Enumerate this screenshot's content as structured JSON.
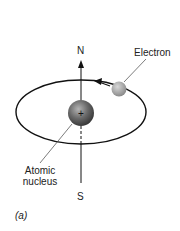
{
  "diagram": {
    "labels": {
      "north": "N",
      "south": "S",
      "electron": "Electron",
      "nucleus_line1": "Atomic",
      "nucleus_line2": "nucleus",
      "panel": "(a)"
    },
    "nucleus_symbol": "+",
    "colors": {
      "line": "#111111",
      "nucleus": "#555555",
      "electron": "#9a9a9a",
      "leader": "#444444"
    }
  }
}
